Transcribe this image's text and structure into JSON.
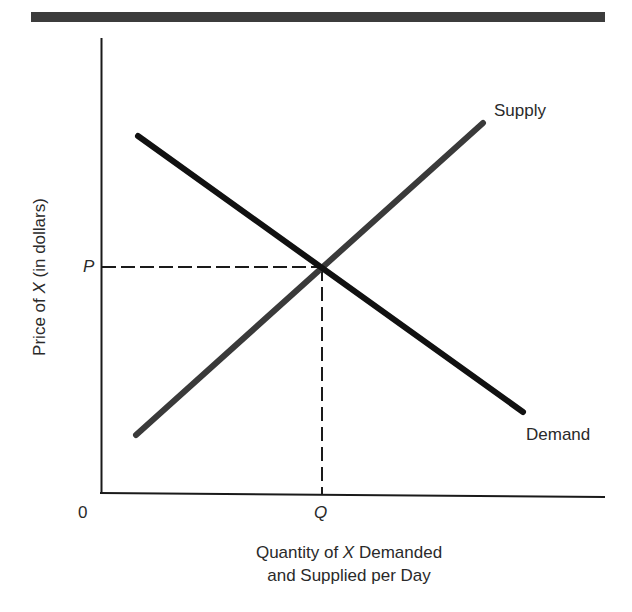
{
  "chart_data": {
    "type": "line",
    "title": "",
    "xlabel": {
      "line1_pre": "Quantity of ",
      "line1_var": "X",
      "line1_post": " Demanded",
      "line2": "and Supplied per Day"
    },
    "ylabel": {
      "pre": "Price of ",
      "var": "X",
      "post": " (in dollars)"
    },
    "origin_label": "0",
    "x_tick_labels": [
      "Q"
    ],
    "y_tick_labels": [
      "P"
    ],
    "grid": false,
    "legend": "inline labels at line ends",
    "series": [
      {
        "name": "Supply",
        "slope": "upward",
        "color": "#3a3a3a",
        "points_px": [
          [
            136,
            435
          ],
          [
            483,
            123
          ]
        ]
      },
      {
        "name": "Demand",
        "slope": "downward",
        "color": "#111111",
        "points_px": [
          [
            138,
            136
          ],
          [
            523,
            412
          ]
        ]
      }
    ],
    "equilibrium": {
      "price_label": "P",
      "quantity_label": "Q",
      "point_px": [
        322,
        267
      ]
    },
    "axes_px": {
      "origin": [
        101,
        493
      ],
      "y_top": 38,
      "x_right": 605
    }
  },
  "labels": {
    "supply": "Supply",
    "demand": "Demand",
    "origin": "0",
    "p": "P",
    "q": "Q"
  }
}
